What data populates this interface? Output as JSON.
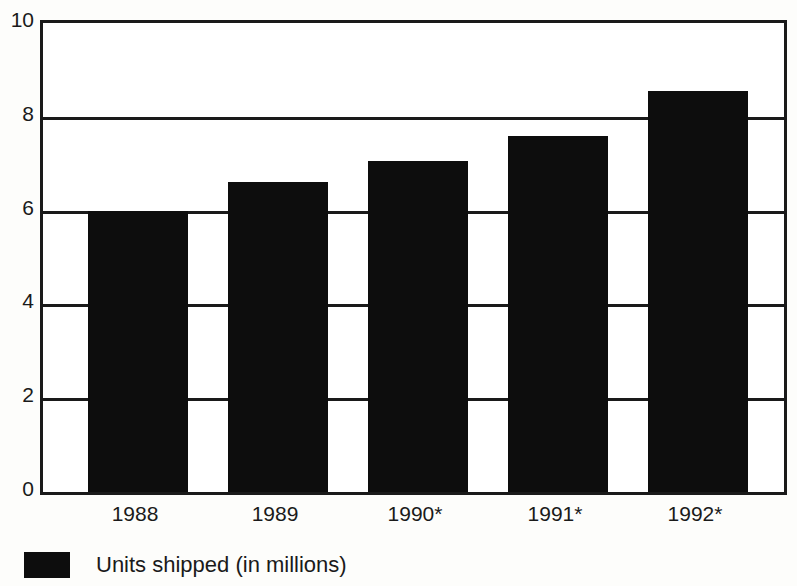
{
  "chart_data": {
    "type": "bar",
    "title": "",
    "subtitle": "",
    "xlabel": "",
    "ylabel": "",
    "categories": [
      "1988",
      "1989",
      "1990*",
      "1991*",
      "1992*"
    ],
    "values": [
      6.0,
      6.6,
      7.05,
      7.6,
      8.55
    ],
    "series": [
      {
        "name": "Units shipped (in millions)",
        "values": [
          6.0,
          6.6,
          7.05,
          7.6,
          8.55
        ],
        "color": "#0d0d0d"
      }
    ],
    "ylim": [
      0,
      10
    ],
    "yticks": [
      0,
      2,
      4,
      6,
      8,
      10
    ],
    "ytick_labels": [
      "0",
      "2",
      "4",
      "6",
      "8",
      "10"
    ],
    "xtick_labels": [
      "1988",
      "1989",
      "1990*",
      "1991*",
      "1992*"
    ],
    "grid": true,
    "grid_axis": "y",
    "legend": {
      "position": "below-left",
      "entries": [
        {
          "label": "Units shipped (in millions)",
          "color": "#0d0d0d"
        }
      ]
    },
    "annotations": [],
    "colors": {
      "bar": "#0d0d0d",
      "axis": "#1a1a1a",
      "grid": "#1a1a1a",
      "background": "#ffffff",
      "text": "#1a1a1a"
    }
  }
}
